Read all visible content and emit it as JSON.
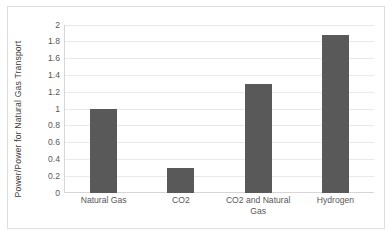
{
  "chart_data": {
    "type": "bar",
    "title": "",
    "xlabel": "",
    "ylabel": "Power/Power for Natural Gas Transport",
    "categories": [
      "Natural Gas",
      "CO2",
      "CO2 and Natural Gas",
      "Hydrogen"
    ],
    "values": [
      1.0,
      0.295,
      1.29,
      1.87
    ],
    "ylim": [
      0,
      2
    ],
    "ytick_labels": [
      "2",
      "1.8",
      "1.6",
      "1.4",
      "1.2",
      "1",
      "0.8",
      "0.6",
      "0.4",
      "0.2",
      "0"
    ],
    "ytick_values": [
      2,
      1.8,
      1.6,
      1.4,
      1.2,
      1,
      0.8,
      0.6,
      0.4,
      0.2,
      0
    ],
    "grid": true,
    "legend": false,
    "legend_position": "none",
    "series": [
      {
        "name": "Power/Power for Natural Gas Transport",
        "values": [
          1.0,
          0.295,
          1.29,
          1.87
        ]
      }
    ],
    "colors": {
      "bar": "#595959",
      "gridline": "#e9e9e7",
      "axis": "#d6d6d4",
      "text": "#575757",
      "background": "#ffffff",
      "border": "#dededc"
    }
  }
}
